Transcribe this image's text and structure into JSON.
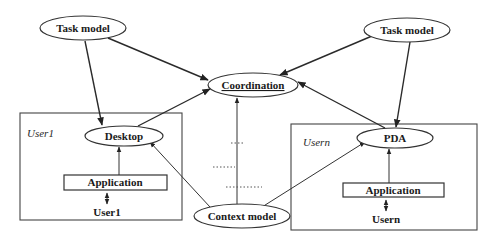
{
  "diagram": {
    "nodes": {
      "task_model_left": "Task model",
      "task_model_right": "Task model",
      "coordination": "Coordination",
      "desktop": "Desktop",
      "pda": "PDA",
      "application_left": "Application",
      "application_right": "Application",
      "user1": "User1",
      "usern": "Usern",
      "context_model": "Context model"
    },
    "groups": {
      "user1_group_label": "User1",
      "usern_group_label": "Usern"
    },
    "edges": [
      {
        "from": "task_model_left",
        "to": "coordination"
      },
      {
        "from": "task_model_left",
        "to": "desktop"
      },
      {
        "from": "task_model_right",
        "to": "coordination"
      },
      {
        "from": "task_model_right",
        "to": "pda"
      },
      {
        "from": "desktop",
        "to": "coordination"
      },
      {
        "from": "pda",
        "to": "coordination"
      },
      {
        "from": "application_left",
        "to": "desktop"
      },
      {
        "from": "application_right",
        "to": "pda"
      },
      {
        "from": "user1",
        "to": "application_left",
        "bidirectional": true
      },
      {
        "from": "usern",
        "to": "application_right",
        "bidirectional": true
      },
      {
        "from": "context_model",
        "to": "coordination"
      },
      {
        "from": "context_model",
        "to": "desktop"
      },
      {
        "from": "context_model",
        "to": "pda"
      }
    ],
    "ellipsis_marker": "......"
  }
}
